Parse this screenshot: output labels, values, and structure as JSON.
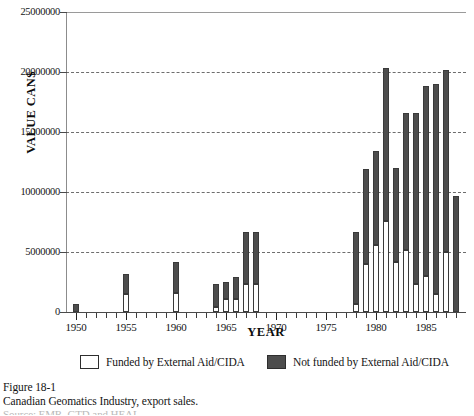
{
  "figure": {
    "caption_label": "Figure 18-1",
    "caption_text": "Canadian Geomatics Industry, export sales.",
    "caption_source": "Source: EMR, GTD and HEAL",
    "colors": {
      "funded_fill": "#ffffff",
      "not_funded_fill": "#4d4d4d",
      "outline": "#3a3a3a",
      "grid": "#6d6d6d",
      "axis": "#4a4a4a",
      "text": "#141414"
    }
  },
  "legend": {
    "position": "bottom",
    "items": [
      {
        "label": "Funded by External Aid/CIDA",
        "swatch": "light"
      },
      {
        "label": "Not funded by External Aid/CIDA",
        "swatch": "dark"
      }
    ]
  },
  "axes": {
    "y_title": "VALUE CAN$",
    "x_title": "YEAR",
    "y_ticks": [
      "0",
      "5000000",
      "10000000",
      "15000000",
      "20000000",
      "25000000"
    ],
    "x_ticks": [
      "1950",
      "1955",
      "1960",
      "1965",
      "1970",
      "1975",
      "1985"
    ],
    "x_tick_1980": "1980",
    "x_tick_1985": "1985"
  },
  "chart_data": {
    "type": "bar",
    "subtype": "stacked",
    "title": "Canadian Geomatics Industry, export sales.",
    "xlabel": "YEAR",
    "ylabel": "VALUE CAN$",
    "xlim": [
      1949,
      1989
    ],
    "ylim": [
      0,
      25000000
    ],
    "ytick_interval": 5000000,
    "grid": "horizontal-dashed",
    "legend_position": "bottom",
    "categories": [
      1950,
      1955,
      1960,
      1964,
      1965,
      1966,
      1967,
      1968,
      1978,
      1979,
      1980,
      1981,
      1982,
      1983,
      1984,
      1985,
      1986,
      1987,
      1988
    ],
    "series": [
      {
        "name": "Funded by External Aid/CIDA",
        "values": [
          0,
          1500000,
          1600000,
          400000,
          1100000,
          1100000,
          2300000,
          2300000,
          700000,
          4000000,
          5600000,
          7600000,
          4200000,
          5200000,
          2300000,
          3000000,
          1500000,
          5000000,
          0
        ]
      },
      {
        "name": "Not funded by External Aid/CIDA",
        "values": [
          700000,
          1700000,
          2600000,
          1900000,
          1400000,
          1800000,
          4400000,
          4400000,
          6000000,
          7900000,
          7800000,
          12700000,
          7800000,
          11400000,
          14300000,
          15800000,
          17500000,
          15200000,
          9700000
        ]
      }
    ],
    "totals": [
      700000,
      3200000,
      4200000,
      2300000,
      2500000,
      2900000,
      6700000,
      6700000,
      6700000,
      11900000,
      13400000,
      20300000,
      12000000,
      16600000,
      16600000,
      18800000,
      19000000,
      20200000,
      9700000
    ]
  }
}
